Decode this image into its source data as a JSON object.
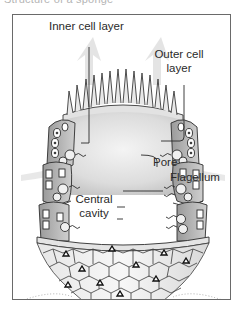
{
  "caption": {
    "text": "Structure of a sponge"
  },
  "figure": {
    "labels": {
      "inner_cell_layer": "Inner cell layer",
      "outer_cell_layer_line1": "Outer cell",
      "outer_cell_layer_line2": "layer",
      "pore": "Pore",
      "flagellum": "Flagellum",
      "central_cavity_line1": "Central",
      "central_cavity_line2": "cavity"
    }
  },
  "colors": {
    "frame_border": "#6a6a6a",
    "ink": "#2a2a2a",
    "shading": "#bdbdbd",
    "background": "#ffffff"
  }
}
